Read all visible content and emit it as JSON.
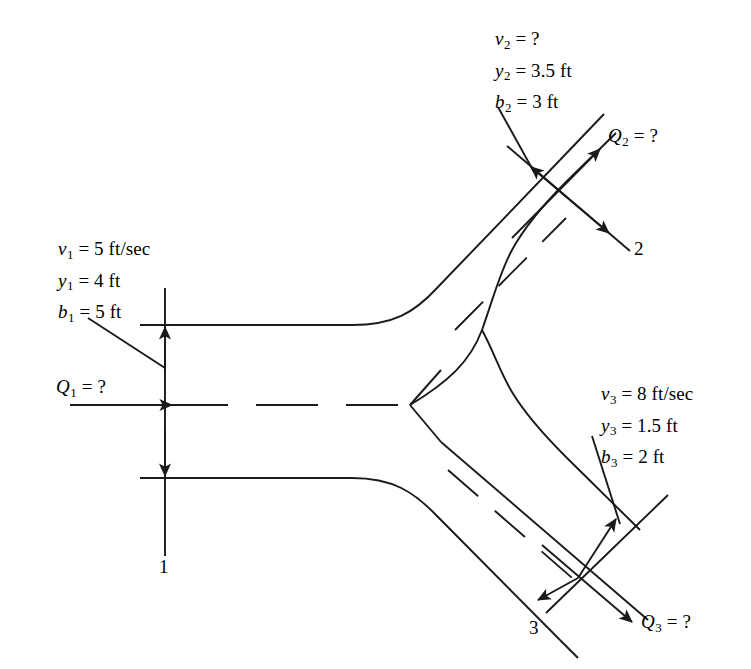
{
  "figure": {
    "ink_color": "#1a1a1a",
    "background": "#ffffff"
  },
  "sections": {
    "inlet": {
      "marker_label": "1",
      "discharge_label_var": "Q",
      "discharge_label_sub": "1",
      "discharge_label_eq": " = ?",
      "params": [
        {
          "var": "v",
          "sub": "1",
          "value": " = 5 ft/sec"
        },
        {
          "var": "y",
          "sub": "1",
          "value": " = 4 ft"
        },
        {
          "var": "b",
          "sub": "1",
          "value": " = 5 ft"
        }
      ]
    },
    "branch2": {
      "marker_label": "2",
      "discharge_label_var": "Q",
      "discharge_label_sub": "2",
      "discharge_label_eq": " = ?",
      "params": [
        {
          "var": "v",
          "sub": "2",
          "value": " = ?"
        },
        {
          "var": "y",
          "sub": "2",
          "value": " = 3.5 ft"
        },
        {
          "var": "b",
          "sub": "2",
          "value": " = 3 ft"
        }
      ]
    },
    "branch3": {
      "marker_label": "3",
      "discharge_label_var": "Q",
      "discharge_label_sub": "3",
      "discharge_label_eq": " = ?",
      "params": [
        {
          "var": "v",
          "sub": "3",
          "value": " = 8 ft/sec"
        },
        {
          "var": "y",
          "sub": "3",
          "value": " = 1.5 ft"
        },
        {
          "var": "b",
          "sub": "3",
          "value": " = 2 ft"
        }
      ]
    }
  }
}
